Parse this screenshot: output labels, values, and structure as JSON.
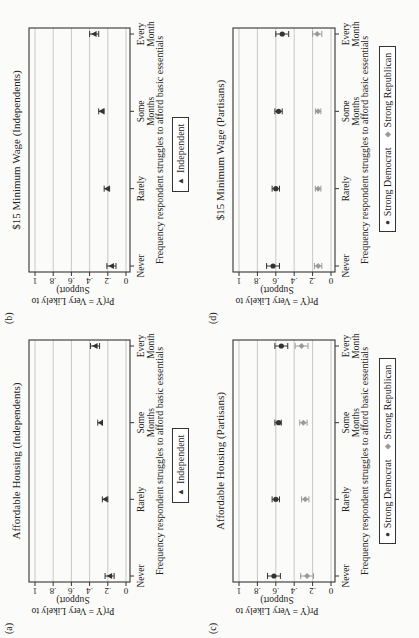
{
  "figure": {
    "orientation": "rotated-90-ccw",
    "x_axis_title": "Frequency respondent struggles to afford basic essentials",
    "y_axis_title_line1": "Pr(Y = Very Likely to",
    "y_axis_title_line2": "Support)",
    "y_ticks": [
      "0",
      ".2",
      ".4",
      ".6",
      ".8",
      "1"
    ],
    "categories": [
      "Never",
      "Rarely",
      "Some\nMonths",
      "Every\nMonth"
    ]
  },
  "panels": [
    {
      "id": "a",
      "letter": "(a)",
      "title": "Affordable Housing (Independents)",
      "legend": [
        {
          "label": "Independent",
          "symbol": "▲",
          "color": "#333333"
        }
      ]
    },
    {
      "id": "b",
      "letter": "(b)",
      "title": "$15 Minimum Wage (Independents)",
      "legend": [
        {
          "label": "Independent",
          "symbol": "▲",
          "color": "#333333"
        }
      ]
    },
    {
      "id": "c",
      "letter": "(c)",
      "title": "Affordable Housing (Partisans)",
      "legend": [
        {
          "label": "Strong Democrat",
          "symbol": "●",
          "color": "#333333"
        },
        {
          "label": "Strong Republican",
          "symbol": "◆",
          "color": "#9a9a9a"
        }
      ]
    },
    {
      "id": "d",
      "letter": "(d)",
      "title": "$15 Minimum Wage (Partisans)",
      "legend": [
        {
          "label": "Strong Democrat",
          "symbol": "●",
          "color": "#333333"
        },
        {
          "label": "Strong Republican",
          "symbol": "◆",
          "color": "#9a9a9a"
        }
      ]
    }
  ],
  "chart_data": [
    {
      "type": "scatter",
      "panel": "a",
      "title": "Affordable Housing (Independents)",
      "xlabel": "Frequency respondent struggles to afford basic essentials",
      "ylabel": "Pr(Y = Very Likely to Support)",
      "categories": [
        "Never",
        "Rarely",
        "Some Months",
        "Every Month"
      ],
      "ylim": [
        0,
        1
      ],
      "yticks": [
        0,
        0.2,
        0.4,
        0.6,
        0.8,
        1
      ],
      "grid": true,
      "legend_position": "bottom",
      "series": [
        {
          "name": "Independent",
          "marker": "triangle",
          "color": "#333333",
          "values": [
            0.18,
            0.23,
            0.28,
            0.34
          ],
          "ci_low": [
            0.13,
            0.2,
            0.26,
            0.29
          ],
          "ci_high": [
            0.23,
            0.26,
            0.31,
            0.39
          ]
        }
      ]
    },
    {
      "type": "scatter",
      "panel": "b",
      "title": "$15 Minimum Wage (Independents)",
      "xlabel": "Frequency respondent struggles to afford basic essentials",
      "ylabel": "Pr(Y = Very Likely to Support)",
      "categories": [
        "Never",
        "Rarely",
        "Some Months",
        "Every Month"
      ],
      "ylim": [
        0,
        1
      ],
      "yticks": [
        0,
        0.2,
        0.4,
        0.6,
        0.8,
        1
      ],
      "grid": true,
      "legend_position": "bottom",
      "series": [
        {
          "name": "Independent",
          "marker": "triangle",
          "color": "#333333",
          "values": [
            0.16,
            0.21,
            0.27,
            0.35
          ],
          "ci_low": [
            0.11,
            0.18,
            0.24,
            0.3
          ],
          "ci_high": [
            0.21,
            0.24,
            0.3,
            0.4
          ]
        }
      ]
    },
    {
      "type": "scatter",
      "panel": "c",
      "title": "Affordable Housing (Partisans)",
      "xlabel": "Frequency respondent struggles to afford basic essentials",
      "ylabel": "Pr(Y = Very Likely to Support)",
      "categories": [
        "Never",
        "Rarely",
        "Some Months",
        "Every Month"
      ],
      "ylim": [
        0,
        1
      ],
      "yticks": [
        0,
        0.2,
        0.4,
        0.6,
        0.8,
        1
      ],
      "grid": true,
      "legend_position": "bottom",
      "series": [
        {
          "name": "Strong Democrat",
          "marker": "circle",
          "color": "#333333",
          "values": [
            0.62,
            0.6,
            0.57,
            0.54
          ],
          "ci_low": [
            0.55,
            0.56,
            0.54,
            0.47
          ],
          "ci_high": [
            0.69,
            0.64,
            0.61,
            0.61
          ]
        },
        {
          "name": "Strong Republican",
          "marker": "diamond",
          "color": "#9a9a9a",
          "values": [
            0.26,
            0.28,
            0.3,
            0.32
          ],
          "ci_low": [
            0.19,
            0.24,
            0.26,
            0.25
          ],
          "ci_high": [
            0.33,
            0.32,
            0.34,
            0.39
          ]
        }
      ]
    },
    {
      "type": "scatter",
      "panel": "d",
      "title": "$15 Minimum Wage (Partisans)",
      "xlabel": "Frequency respondent struggles to afford basic essentials",
      "ylabel": "Pr(Y = Very Likely to Support)",
      "categories": [
        "Never",
        "Rarely",
        "Some Months",
        "Every Month"
      ],
      "ylim": [
        0,
        1
      ],
      "yticks": [
        0,
        0.2,
        0.4,
        0.6,
        0.8,
        1
      ],
      "grid": true,
      "legend_position": "bottom",
      "series": [
        {
          "name": "Strong Democrat",
          "marker": "circle",
          "color": "#333333",
          "values": [
            0.63,
            0.6,
            0.57,
            0.53
          ],
          "ci_low": [
            0.56,
            0.56,
            0.53,
            0.46
          ],
          "ci_high": [
            0.7,
            0.64,
            0.61,
            0.6
          ]
        },
        {
          "name": "Strong Republican",
          "marker": "diamond",
          "color": "#9a9a9a",
          "values": [
            0.14,
            0.14,
            0.14,
            0.15
          ],
          "ci_low": [
            0.1,
            0.11,
            0.11,
            0.1
          ],
          "ci_high": [
            0.18,
            0.17,
            0.17,
            0.2
          ]
        }
      ]
    }
  ]
}
